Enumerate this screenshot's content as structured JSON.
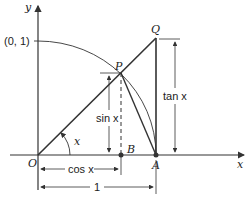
{
  "figure": {
    "axis_labels": {
      "x": "x",
      "y": "y"
    },
    "points": {
      "origin": "O",
      "unit_point": "(0, 1)",
      "p": "P",
      "q": "Q",
      "b": "B",
      "a": "A"
    },
    "angle_label": "x",
    "measures": {
      "sin": "sin x",
      "cos": "cos x",
      "tan": "tan x",
      "one": "1"
    },
    "stroke_color": "#333333"
  }
}
